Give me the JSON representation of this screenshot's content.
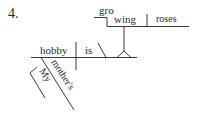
{
  "problem_number": "4.",
  "words": {
    "subject": "hobby",
    "verb": "is",
    "gerund_part1": "gro",
    "gerund_part2": "wing",
    "object": "roses",
    "modifier_possessive": "mother's",
    "modifier_my": "My"
  },
  "colors": {
    "line": "#3a3a3a",
    "text": "#2a2a2a"
  }
}
